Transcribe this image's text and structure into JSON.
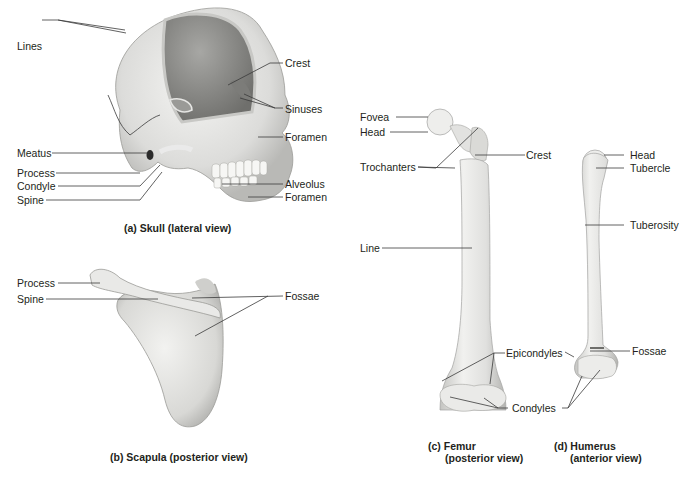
{
  "figure": {
    "panels": [
      {
        "id": "a",
        "caption": "(a) Skull (lateral view)",
        "labels": {
          "lines": "Lines",
          "crest": "Crest",
          "sinuses": "Sinuses",
          "foramen_upper": "Foramen",
          "meatus": "Meatus",
          "process": "Process",
          "condyle": "Condyle",
          "spine": "Spine",
          "alveolus": "Alveolus",
          "foramen_lower": "Foramen"
        }
      },
      {
        "id": "b",
        "caption": "(b) Scapula (posterior view)",
        "labels": {
          "process": "Process",
          "spine": "Spine",
          "fossae": "Fossae"
        }
      },
      {
        "id": "c",
        "caption_line1": "(c) Femur",
        "caption_line2": "(posterior view)",
        "labels": {
          "fovea": "Fovea",
          "head": "Head",
          "trochanters": "Trochanters",
          "crest": "Crest",
          "line": "Line",
          "epicondyles": "Epicondyles",
          "condyles": "Condyles"
        }
      },
      {
        "id": "d",
        "caption_line1": "(d) Humerus",
        "caption_line2": "(anterior view)",
        "labels": {
          "head": "Head",
          "tubercle": "Tubercle",
          "tuberosity": "Tuberosity",
          "fossae": "Fossae"
        }
      }
    ],
    "colors": {
      "bone_light": "#f2f2f0",
      "bone_mid": "#d9d9d6",
      "bone_shadow": "#b5b5b2",
      "cranial_cavity": "#8f8f8c",
      "leader_line": "#3a3a3a",
      "text": "#231f20"
    }
  }
}
